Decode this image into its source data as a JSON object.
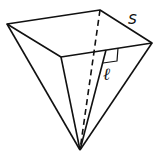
{
  "diagram": {
    "type": "inverted square pyramid",
    "labels": {
      "side": "s",
      "slant_height": "ℓ"
    },
    "colors": {
      "stroke": "#111111",
      "background": "#ffffff"
    }
  }
}
